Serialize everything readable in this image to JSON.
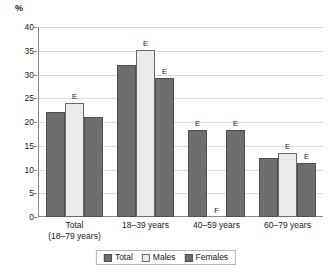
{
  "chart_data": {
    "type": "bar",
    "title": "",
    "subtitle": "",
    "xlabel": "",
    "ylabel": "%",
    "ylim": [
      0,
      40
    ],
    "yticks": [
      0,
      5,
      10,
      15,
      20,
      25,
      30,
      35,
      40
    ],
    "ytick_labels": [
      "0",
      "5",
      "10",
      "15",
      "20",
      "25",
      "30",
      "35",
      "40"
    ],
    "grid": true,
    "legend_position": "bottom",
    "categories": [
      "Total\n(18–79 years)",
      "18–39 years",
      "40–59 years",
      "60–79 years"
    ],
    "category_lines": [
      [
        "Total",
        "(18–79 years)"
      ],
      [
        "18–39 years",
        ""
      ],
      [
        "40–59 years",
        ""
      ],
      [
        "60–79 years",
        ""
      ]
    ],
    "series": [
      {
        "name": "Total",
        "color": "#6e6e6e",
        "values": [
          22.1,
          32.1,
          18.3,
          12.4
        ],
        "flags": [
          "",
          "",
          "E",
          ""
        ]
      },
      {
        "name": "Males",
        "color": "#eaeaea",
        "values": [
          24.1,
          35.1,
          null,
          13.5
        ],
        "flags": [
          "E",
          "E",
          "F",
          "E"
        ]
      },
      {
        "name": "Females",
        "color": "#6e6e6e",
        "values": [
          21.1,
          29.2,
          18.3,
          11.4
        ],
        "flags": [
          "",
          "E",
          "E",
          "E"
        ]
      }
    ],
    "annotations": [
      {
        "text": "E",
        "meaning": "estimate-quality-marker"
      },
      {
        "text": "F",
        "meaning": "suppressed-value-marker"
      }
    ]
  },
  "legend": {
    "items": [
      {
        "label": "Total",
        "swatch": "series-total"
      },
      {
        "label": "Males",
        "swatch": "series-males"
      },
      {
        "label": "Females",
        "swatch": "series-females"
      }
    ]
  }
}
